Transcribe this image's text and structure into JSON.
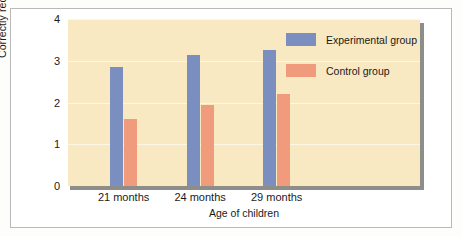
{
  "chart_data": {
    "type": "bar",
    "title": "",
    "xlabel": "Age of children",
    "ylabel": "Correctly recalled tasks",
    "categories": [
      "21 months",
      "24 months",
      "29 months"
    ],
    "series": [
      {
        "name": "Experimental group",
        "values": [
          2.85,
          3.15,
          3.25
        ],
        "color": "#7a8fc0"
      },
      {
        "name": "Control group",
        "values": [
          1.6,
          1.95,
          2.2
        ],
        "color": "#ef9b7c"
      }
    ],
    "ylim": [
      0,
      4
    ],
    "yticks": [
      "0",
      "1",
      "2",
      "3",
      "4"
    ],
    "grid": true,
    "legend_position": "top-right",
    "plot_background": "#f8e9c2",
    "figure_background": "#ffffff"
  }
}
